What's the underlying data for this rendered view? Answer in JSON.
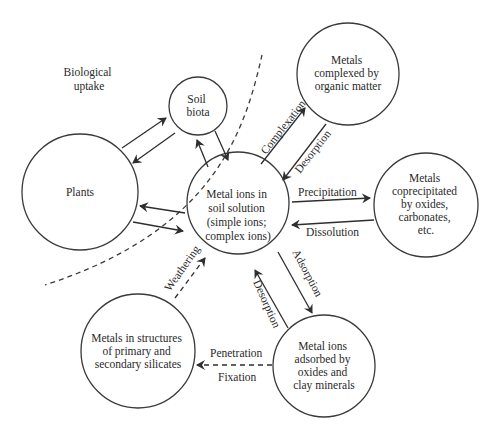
{
  "diagram": {
    "region_label": [
      "Biological",
      "uptake"
    ],
    "nodes": {
      "plants": {
        "lines": [
          "Plants"
        ]
      },
      "soil_biota": {
        "lines": [
          "Soil",
          "biota"
        ]
      },
      "center": {
        "lines": [
          "Metal ions in",
          "soil solution",
          "(simple ions;",
          "complex ions)"
        ]
      },
      "organic": {
        "lines": [
          "Metals",
          "complexed by",
          "organic matter"
        ]
      },
      "coprecipitated": {
        "lines": [
          "Metals",
          "coprecipitated",
          "by oxides,",
          "carbonates,",
          "etc."
        ]
      },
      "adsorbed": {
        "lines": [
          "Metal ions",
          "adsorbed by",
          "oxides and",
          "clay minerals"
        ]
      },
      "silicates": {
        "lines": [
          "Metals in structures",
          "of primary and",
          "secondary silicates"
        ]
      }
    },
    "edge_labels": {
      "complexation": "Complexation",
      "desorption_organic": "Desorption",
      "precipitation": "Precipitation",
      "dissolution": "Dissolution",
      "adsorption": "Adsorption",
      "desorption_clay": "Desorption",
      "weathering": "Weathering",
      "penetration": "Penetration",
      "fixation": "Fixation"
    },
    "colors": {
      "stroke": "#3a3a3a",
      "text": "#2a2a2a",
      "background": "#ffffff"
    }
  }
}
